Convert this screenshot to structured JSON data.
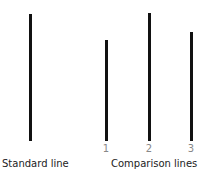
{
  "standard": {
    "label": "Standard line",
    "x": 29,
    "top": 14,
    "bottom": 141
  },
  "comparison": {
    "label": "Comparison lines",
    "lines": [
      {
        "number": "1",
        "x": 105,
        "top": 40,
        "bottom": 141
      },
      {
        "number": "2",
        "x": 148,
        "top": 13,
        "bottom": 141
      },
      {
        "number": "3",
        "x": 190,
        "top": 32,
        "bottom": 141
      }
    ]
  },
  "colors": {
    "line": "#111111",
    "number": "#888888",
    "label": "#222222"
  }
}
